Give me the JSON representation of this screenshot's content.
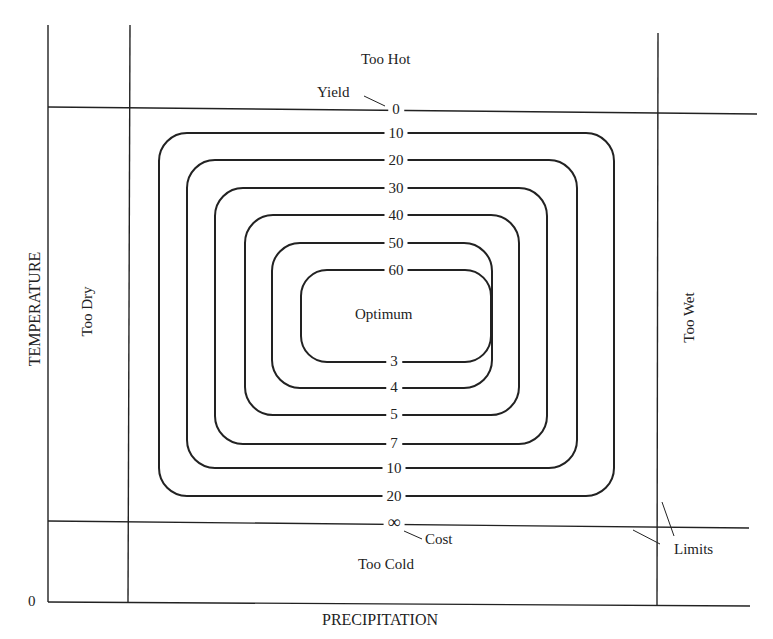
{
  "diagram": {
    "axes": {
      "x_label": "PRECIPITATION",
      "y_label": "TEMPERATURE",
      "origin": "0"
    },
    "regions": {
      "top": "Too Hot",
      "bottom": "Too Cold",
      "left": "Too Dry",
      "right": "Too Wet",
      "center": "Optimum"
    },
    "annotations": {
      "yield": "Yield",
      "cost": "Cost",
      "limits": "Limits"
    },
    "yield_labels": [
      "0",
      "10",
      "20",
      "30",
      "40",
      "50",
      "60"
    ],
    "cost_labels": [
      "3",
      "4",
      "5",
      "7",
      "10",
      "20",
      "∞"
    ]
  }
}
